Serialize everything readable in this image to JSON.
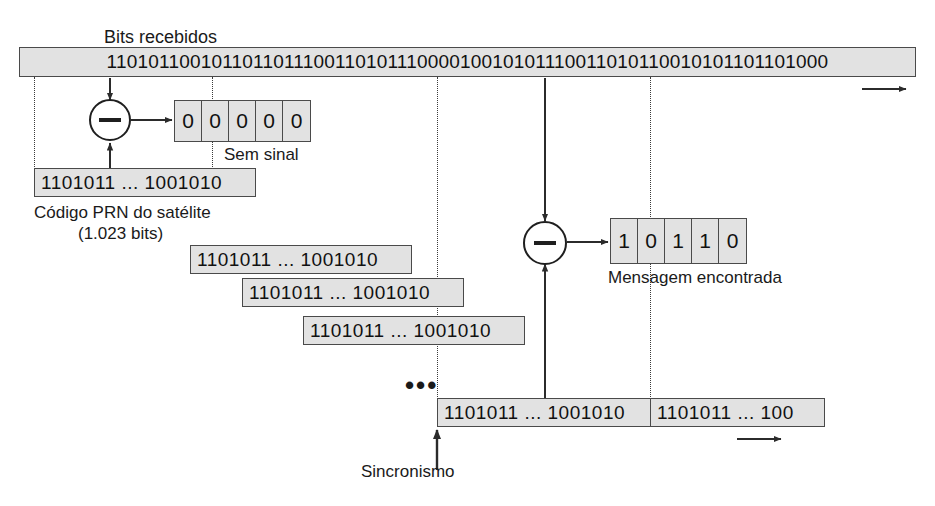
{
  "diagram": {
    "title_label": "Bits recebidos",
    "received_bits": "11010110010110110111001101011100001001010111001101011001010110 1101000",
    "received_bits_display": "1101011001011011011100110101110000100101011100110101100101011 01101000",
    "received_stream": "110101100101101101110011010111000010010101110011010110010101101101000",
    "no_signal": {
      "cells": [
        "0",
        "0",
        "0",
        "0",
        "0"
      ],
      "caption": "Sem sinal"
    },
    "prn": {
      "code": "1101011 ... 1001010",
      "caption_line1": "Código PRN do satélite",
      "caption_line2": "(1.023 bits)"
    },
    "staircase": [
      "1101011 ... 1001010",
      "1101011 ... 1001010",
      "1101011 ... 1001010"
    ],
    "ellipsis": "•••",
    "aligned_row": {
      "left": "1101011 ... 1001010",
      "right": "1101011 ... 100"
    },
    "sync_label": "Sincronismo",
    "message": {
      "cells": [
        "1",
        "0",
        "1",
        "1",
        "0"
      ],
      "caption": "Mensagem encontrada"
    },
    "operator_symbol": "−",
    "colors": {
      "box_fill": "#e2e2e2",
      "box_stroke": "#4a4a4a",
      "line": "#2b2b2b",
      "text": "#1a1a1a"
    }
  }
}
